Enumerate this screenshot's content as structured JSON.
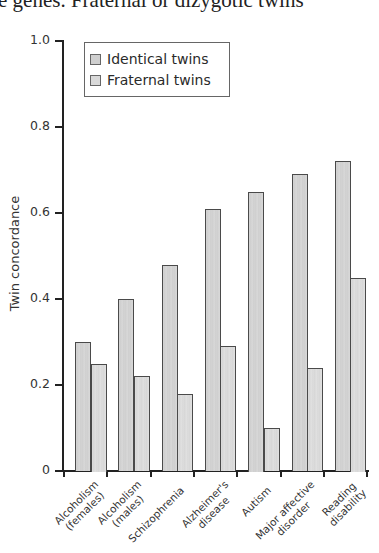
{
  "caption_fragment": "e genes. Fraternal or dizygotic twins",
  "chart_data": {
    "type": "bar",
    "title": "",
    "xlabel": "",
    "ylabel": "Twin concordance",
    "ylim": [
      0,
      1.0
    ],
    "yticks": [
      "0",
      "0.2",
      "0.4",
      "0.6",
      "0.8",
      "1.0"
    ],
    "grid": false,
    "legend_position": "top-left inside",
    "categories": [
      "Alcoholism (females)",
      "Alcoholism (males)",
      "Schizophrenia",
      "Alzheimer's disease",
      "Autism",
      "Major affective disorder",
      "Reading disability"
    ],
    "series": [
      {
        "name": "Identical twins",
        "values": [
          0.3,
          0.4,
          0.48,
          0.61,
          0.65,
          0.69,
          0.72
        ]
      },
      {
        "name": "Fraternal twins",
        "values": [
          0.25,
          0.22,
          0.18,
          0.29,
          0.1,
          0.24,
          0.45
        ]
      }
    ]
  },
  "legend": {
    "items": [
      {
        "label": "Identical twins"
      },
      {
        "label": "Fraternal twins"
      }
    ]
  },
  "xlabels": [
    {
      "line1": "Alcoholism",
      "line2": "(females)"
    },
    {
      "line1": "Alcoholism",
      "line2": "(males)"
    },
    {
      "line1": "Schizophrenia",
      "line2": ""
    },
    {
      "line1": "Alzheimer's",
      "line2": "disease"
    },
    {
      "line1": "Autism",
      "line2": ""
    },
    {
      "line1": "Major affective",
      "line2": "disorder"
    },
    {
      "line1": "Reading",
      "line2": "disability"
    }
  ]
}
